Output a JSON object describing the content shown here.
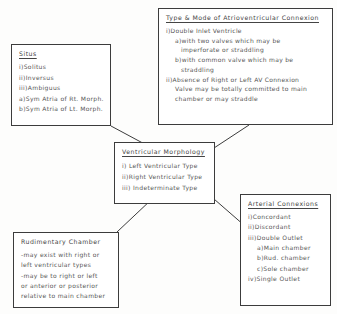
{
  "diagram": {
    "background_color": "#fdfdfc",
    "line_color": "#3c3c3c",
    "text_color": "#575757"
  },
  "nodes": {
    "atrioventricular": {
      "title": "Type & Mode of Atrioventricular Connexion",
      "lines": [
        {
          "text": "i)Double Inlet Ventricle",
          "level": 1
        },
        {
          "text": "a)with two valves which may be",
          "level": 2
        },
        {
          "text": "imperforate or straddling",
          "level": 3
        },
        {
          "text": "b)with common valve which may be",
          "level": 2
        },
        {
          "text": "straddling",
          "level": 3
        },
        {
          "text": "ii)Absence of Right or Left AV Connexion",
          "level": 1
        },
        {
          "text": "Valve may be totally committed to main",
          "level": 2
        },
        {
          "text": "chamber or may straddle",
          "level": 2
        }
      ]
    },
    "situs": {
      "title": "Situs",
      "lines": [
        {
          "text": "i)Solitus",
          "level": 1
        },
        {
          "text": "ii)Inversus",
          "level": 1
        },
        {
          "text": "iii)Ambiguus",
          "level": 1
        },
        {
          "text": "a)Sym Atria of Rt. Morph.",
          "level": 1
        },
        {
          "text": "b)Sym Atria of Lt. Morph.",
          "level": 1
        }
      ]
    },
    "ventricular": {
      "title": "Ventricular Morphology",
      "lines": [
        {
          "text": "i) Left Ventricular Type",
          "level": 1
        },
        {
          "text": "ii)Right Ventricular Type",
          "level": 1
        },
        {
          "text": "iii) Indeterminate Type",
          "level": 1
        }
      ]
    },
    "arterial": {
      "title": "Arterial Connexions",
      "lines": [
        {
          "text": "i)Concordant",
          "level": 1
        },
        {
          "text": "ii)Discordant",
          "level": 1
        },
        {
          "text": "iii)Double Outlet",
          "level": 1
        },
        {
          "text": "a)Main chamber",
          "level": 2
        },
        {
          "text": "b)Rud. chamber",
          "level": 2
        },
        {
          "text": "c)Sole chamber",
          "level": 2
        },
        {
          "text": "iv)Single Outlet",
          "level": 1
        }
      ]
    },
    "rudimentary": {
      "title": "Rudimentary Chamber",
      "lines": [
        {
          "text": "-may exist with right or",
          "level": 1
        },
        {
          "text": "left ventricular types",
          "level": 1
        },
        {
          "text": "-may be to right or left",
          "level": 1
        },
        {
          "text": "or anterior or posterior",
          "level": 1
        },
        {
          "text": "relative to main chamber",
          "level": 1
        }
      ]
    }
  },
  "connectors": [
    {
      "name": "situs-to-ventricular",
      "x1": 111,
      "y1": 126,
      "x2": 152,
      "y2": 148
    },
    {
      "name": "atrioventricular-to-ventricular",
      "x1": 214,
      "y1": 148,
      "x2": 249,
      "y2": 125
    },
    {
      "name": "ventricular-to-arterial",
      "x1": 214,
      "y1": 199,
      "x2": 245,
      "y2": 226
    },
    {
      "name": "ventricular-to-rudimentary",
      "x1": 152,
      "y1": 199,
      "x2": 117,
      "y2": 232
    }
  ]
}
